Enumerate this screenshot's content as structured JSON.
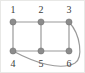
{
  "figure": {
    "width": 85,
    "height": 73,
    "background_color": "#ffffff",
    "border_color": "#e8e8e6"
  },
  "style": {
    "node_fill": "#8c8c8c",
    "node_stroke": "#6f6f6f",
    "node_radius": 3.1,
    "edge_color": "#9a9a9a",
    "edge_width": 1.2,
    "label_color": "#3b3b3b",
    "label_font_size": 10
  },
  "graph": {
    "type": "undirected",
    "node_count": 6,
    "edge_count": 8,
    "nodes": [
      {
        "id": "1",
        "label": "1",
        "cx": 12,
        "cy": 21,
        "label_x": 6,
        "label_y": 4
      },
      {
        "id": "2",
        "label": "2",
        "cx": 40,
        "cy": 21,
        "label_x": 34,
        "label_y": 4
      },
      {
        "id": "3",
        "label": "3",
        "cx": 68,
        "cy": 21,
        "label_x": 62,
        "label_y": 4
      },
      {
        "id": "4",
        "label": "4",
        "cx": 12,
        "cy": 50,
        "label_x": 6,
        "label_y": 58
      },
      {
        "id": "5",
        "label": "5",
        "cx": 40,
        "cy": 50,
        "label_x": 34,
        "label_y": 58
      },
      {
        "id": "6",
        "label": "6",
        "cx": 68,
        "cy": 50,
        "label_x": 62,
        "label_y": 58
      }
    ],
    "edges": [
      {
        "id": "e1-2",
        "source": "1",
        "target": "2",
        "shape": "straight",
        "path": "M 12 21 L 40 21"
      },
      {
        "id": "e2-3",
        "source": "2",
        "target": "3",
        "shape": "straight",
        "path": "M 40 21 L 68 21"
      },
      {
        "id": "e4-5",
        "source": "4",
        "target": "5",
        "shape": "straight",
        "path": "M 12 50 L 40 50"
      },
      {
        "id": "e5-6",
        "source": "5",
        "target": "6",
        "shape": "straight",
        "path": "M 40 50 L 68 50"
      },
      {
        "id": "e1-4",
        "source": "1",
        "target": "4",
        "shape": "straight",
        "path": "M 12 21 L 12 50"
      },
      {
        "id": "e2-5",
        "source": "2",
        "target": "5",
        "shape": "straight",
        "path": "M 40 21 L 40 50"
      },
      {
        "id": "e3-6",
        "source": "3",
        "target": "6",
        "shape": "straight",
        "path": "M 68 21 L 68 50"
      },
      {
        "id": "e4-3",
        "source": "4",
        "target": "3",
        "shape": "curved",
        "path": "M 12 50 C 34 62 60 70 74 62 C 82 57 80 34 68 21"
      }
    ]
  }
}
